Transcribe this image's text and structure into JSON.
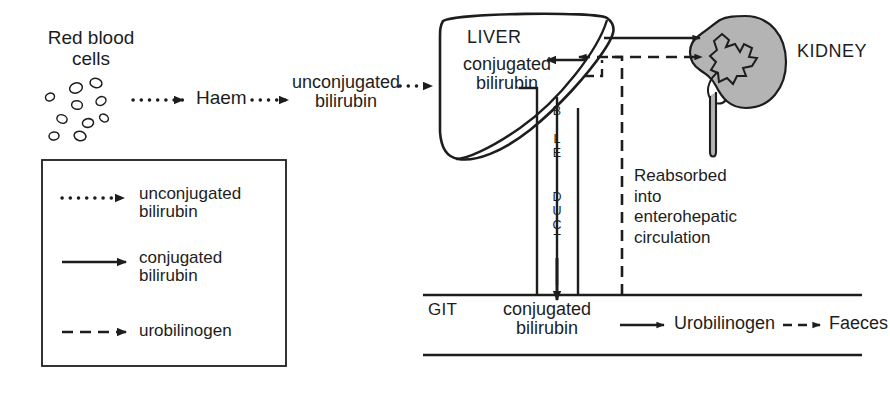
{
  "figure": {
    "colors": {
      "stroke": "#1d1d1d",
      "text": "#1d1d1d",
      "kidney_fill": "#b4b4b4",
      "background": "#ffffff"
    }
  },
  "nodes": {
    "red_blood_cells": {
      "line1": "Red blood",
      "line2": "cells"
    },
    "haem": {
      "label": "Haem"
    },
    "unconjugated_bilirubin": {
      "line1": "unconjugated",
      "line2": "bilirubin"
    },
    "liver": {
      "label": "LIVER"
    },
    "liver_conjugated_bilirubin": {
      "line1": "conjugated",
      "line2": "bilirubin"
    },
    "kidney": {
      "label": "KIDNEY"
    },
    "bile_duct": {
      "label": "BILE DUCT",
      "letters_top": [
        "B",
        "I",
        "L",
        "E"
      ],
      "letters_bottom": [
        "D",
        "U",
        "C",
        "T"
      ]
    },
    "reabsorbed": {
      "line1": "Reabsorbed",
      "line2": "into",
      "line3": "enterohepatic",
      "line4": "circulation"
    },
    "git": {
      "label": "GIT"
    },
    "git_conjugated_bilirubin": {
      "line1": "conjugated",
      "line2": "bilirubin"
    },
    "urobilinogen": {
      "label": "Urobilinogen"
    },
    "faeces": {
      "label": "Faeces"
    }
  },
  "legend": {
    "items": [
      {
        "style": "dotted",
        "line1": "unconjugated",
        "line2": "bilirubin"
      },
      {
        "style": "solid",
        "line1": "conjugated",
        "line2": "bilirubin"
      },
      {
        "style": "dashed",
        "line1": "urobilinogen",
        "line2": ""
      }
    ]
  },
  "edges": [
    {
      "from": "red_blood_cells",
      "to": "haem",
      "style": "dotted",
      "meaning": "unconjugated bilirubin"
    },
    {
      "from": "haem",
      "to": "unconjugated_bilirubin",
      "style": "dotted",
      "meaning": "unconjugated bilirubin"
    },
    {
      "from": "unconjugated_bilirubin",
      "to": "liver",
      "style": "dotted",
      "meaning": "unconjugated bilirubin"
    },
    {
      "from": "liver",
      "to": "kidney",
      "style": "solid",
      "meaning": "conjugated bilirubin"
    },
    {
      "from": "git_urobilinogen",
      "to": "kidney",
      "style": "dashed",
      "meaning": "urobilinogen"
    },
    {
      "from": "git_urobilinogen",
      "to": "liver",
      "style": "dashed",
      "meaning": "urobilinogen reabsorbed"
    },
    {
      "from": "liver",
      "to": "git",
      "style": "solid",
      "meaning": "conjugated bilirubin via bile duct"
    },
    {
      "from": "git_conjugated_bilirubin",
      "to": "urobilinogen",
      "style": "solid",
      "meaning": "conjugated bilirubin"
    },
    {
      "from": "urobilinogen",
      "to": "faeces",
      "style": "dashed",
      "meaning": "urobilinogen"
    }
  ]
}
